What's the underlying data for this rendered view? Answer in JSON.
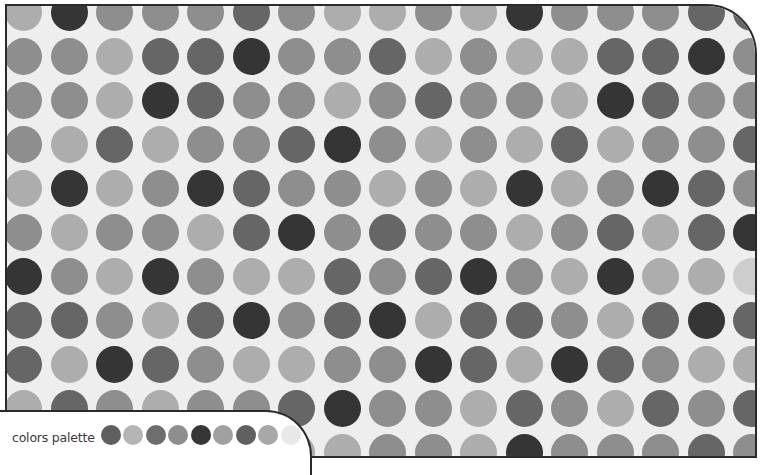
{
  "palette": {
    "label": "colors palette",
    "swatches": [
      "#5f5f5f",
      "#b4b4b4",
      "#6e6e6e",
      "#8e8e8e",
      "#363636",
      "#a0a0a0",
      "#606060",
      "#a8a8a8",
      "#e8e8e8"
    ]
  },
  "shades": {
    "1": "#cdcdcd",
    "2": "#adadad",
    "3": "#8e8e8e",
    "4": "#666666",
    "5": "#353535"
  },
  "colors": {
    "background": "#eeeeee",
    "frame_border": "#2a2a2a",
    "page": "#ffffff"
  },
  "grid": {
    "cols": 17,
    "rows": 11,
    "cell_size": 37,
    "pitch_x": 45.5,
    "pitch_y": 44,
    "origin_x": -2,
    "origin_y": -12,
    "cells": [
      [
        2,
        5,
        3,
        3,
        3,
        4,
        3,
        2,
        2,
        3,
        2,
        5,
        3,
        3,
        3,
        4,
        4
      ],
      [
        3,
        3,
        2,
        4,
        4,
        5,
        3,
        3,
        4,
        2,
        3,
        2,
        2,
        4,
        4,
        5,
        3
      ],
      [
        3,
        3,
        2,
        5,
        4,
        3,
        3,
        2,
        3,
        4,
        3,
        3,
        2,
        5,
        4,
        3,
        3
      ],
      [
        3,
        2,
        4,
        2,
        3,
        3,
        4,
        5,
        3,
        2,
        3,
        2,
        4,
        2,
        3,
        3,
        4
      ],
      [
        2,
        5,
        2,
        3,
        5,
        4,
        3,
        3,
        2,
        3,
        2,
        5,
        2,
        3,
        5,
        4,
        3
      ],
      [
        3,
        2,
        3,
        3,
        2,
        4,
        5,
        3,
        4,
        3,
        3,
        2,
        3,
        4,
        2,
        4,
        5
      ],
      [
        5,
        3,
        2,
        5,
        3,
        2,
        2,
        4,
        3,
        4,
        5,
        3,
        2,
        5,
        2,
        2,
        1
      ],
      [
        4,
        4,
        3,
        2,
        4,
        5,
        3,
        4,
        5,
        2,
        4,
        4,
        3,
        2,
        4,
        5,
        4
      ],
      [
        4,
        2,
        5,
        4,
        3,
        2,
        2,
        3,
        3,
        5,
        4,
        2,
        5,
        4,
        3,
        2,
        2
      ],
      [
        2,
        4,
        3,
        2,
        3,
        3,
        4,
        5,
        3,
        3,
        2,
        4,
        3,
        2,
        4,
        3,
        4
      ],
      [
        3,
        2,
        3,
        2,
        2,
        3,
        2,
        2,
        3,
        3,
        2,
        5,
        3,
        3,
        3,
        4,
        3
      ]
    ]
  }
}
